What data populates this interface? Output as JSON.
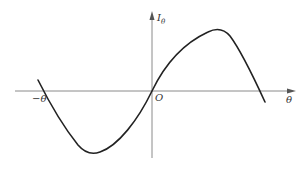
{
  "diagram": {
    "title": "",
    "type": "function-plot",
    "x_axis_label": "θ",
    "x_axis_negative_label": "−θ",
    "y_axis_label": "I",
    "y_axis_label_subscript": "θ",
    "origin_label": "O",
    "curve_description": "S-shaped curve: crosses x-axis at −θ, minimum in negative region, passes through origin O, maximum in positive region, crosses x-axis at θ",
    "colors": {
      "axis": "#8a8a8a",
      "curve": "#222222",
      "text": "#333333"
    }
  }
}
